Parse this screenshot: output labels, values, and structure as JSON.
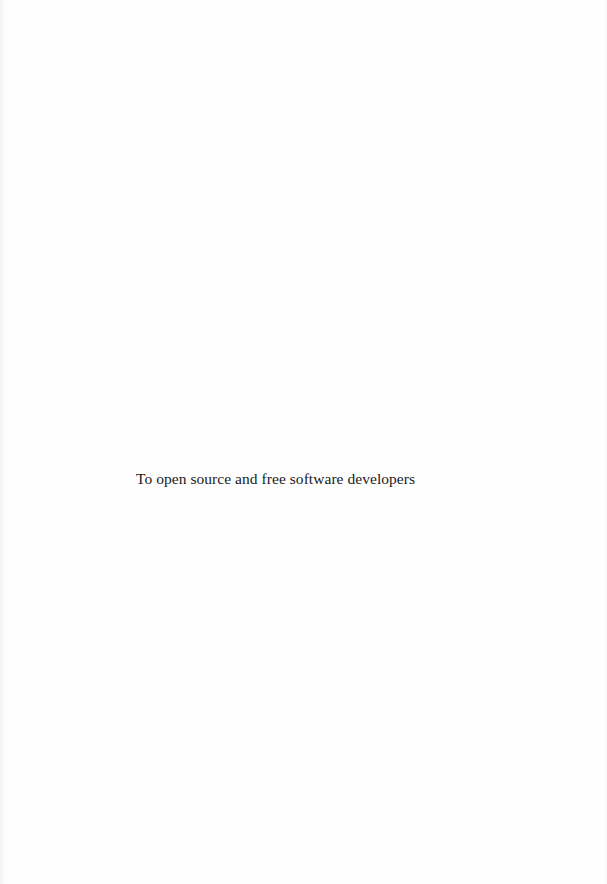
{
  "page": {
    "dedication": "To open source and free software developers"
  }
}
